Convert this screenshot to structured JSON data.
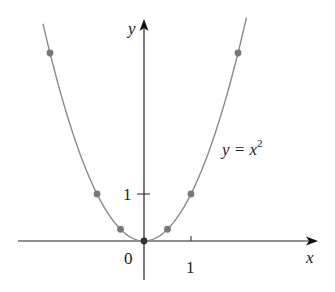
{
  "chart_data": {
    "type": "line",
    "title": "",
    "xlabel": "x",
    "ylabel": "y",
    "function_label": "y = x",
    "function_label_exponent": "2",
    "equation": "y = x^2",
    "x_ticks": [
      {
        "value": 1,
        "label": "1"
      }
    ],
    "y_ticks": [
      {
        "value": 1,
        "label": "1"
      }
    ],
    "origin_label": "0",
    "xlim": [
      -2.45,
      3.7
    ],
    "ylim": [
      -0.9,
      4.7
    ],
    "grid": false,
    "legend": null,
    "curve": {
      "domain": [
        -2.15,
        2.18
      ],
      "color": "#8a8a8a"
    },
    "points": [
      {
        "x": -2,
        "y": 4
      },
      {
        "x": -1,
        "y": 1
      },
      {
        "x": -0.5,
        "y": 0.25
      },
      {
        "x": 0,
        "y": 0
      },
      {
        "x": 0.5,
        "y": 0.25
      },
      {
        "x": 1,
        "y": 1
      },
      {
        "x": 2,
        "y": 4
      }
    ],
    "colors": {
      "axes": "#222222",
      "curve": "#8a8a8a",
      "points": "#777777",
      "origin_point": "#333333"
    }
  }
}
